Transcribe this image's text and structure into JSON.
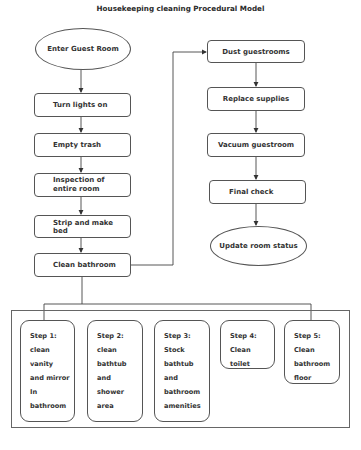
{
  "title": "Housekeeping cleaning Procedural Model",
  "left_column": [
    {
      "id": "enter-guest-room",
      "shape": "ellipse",
      "label": "Enter Guest Room"
    },
    {
      "id": "turn-lights-on",
      "shape": "rect",
      "label": "Turn lights on"
    },
    {
      "id": "empty-trash",
      "shape": "rect",
      "label": "Empty trash"
    },
    {
      "id": "inspection",
      "shape": "rect",
      "label_lines": [
        "Inspection of",
        "entire room"
      ]
    },
    {
      "id": "strip-make-bed",
      "shape": "rect",
      "label": "Strip and make bed"
    },
    {
      "id": "clean-bathroom",
      "shape": "rect",
      "label": "Clean bathroom"
    }
  ],
  "right_column": [
    {
      "id": "dust-guestrooms",
      "shape": "rect",
      "label": "Dust guestrooms"
    },
    {
      "id": "replace-supplies",
      "shape": "rect",
      "label": "Replace supplies"
    },
    {
      "id": "vacuum-guestroom",
      "shape": "rect",
      "label": "Vacuum guestroom"
    },
    {
      "id": "final-check",
      "shape": "rect",
      "label": "Final check"
    },
    {
      "id": "update-room-status",
      "shape": "ellipse",
      "label": "Update room status"
    }
  ],
  "bathroom_steps": [
    {
      "lines": [
        "Step 1:",
        "clean",
        "vanity",
        "and mirror",
        "In",
        "bathroom"
      ]
    },
    {
      "lines": [
        "Step 2:",
        "clean",
        "bathtub",
        "and",
        "shower",
        "area"
      ]
    },
    {
      "lines": [
        "Step 3:",
        "Stock",
        "bathtub",
        "and",
        "bathroom",
        "amenities"
      ]
    },
    {
      "lines": [
        "Step 4:",
        "Clean",
        "toilet"
      ]
    },
    {
      "lines": [
        "Step 5:",
        "Clean",
        "bathroom",
        "floor"
      ]
    }
  ],
  "colors": {
    "stroke": "#555555",
    "text": "#333333",
    "background": "#ffffff"
  }
}
